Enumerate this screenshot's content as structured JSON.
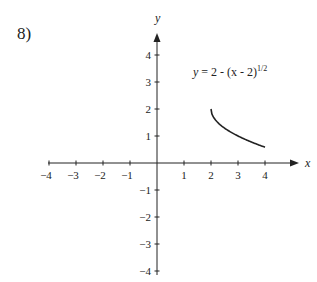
{
  "problem": {
    "number": "8)"
  },
  "chart_data": {
    "type": "line",
    "title": "",
    "xlabel": "x",
    "ylabel": "y",
    "xlim": [
      -4,
      4
    ],
    "ylim": [
      -4,
      4
    ],
    "grid": false,
    "x_ticks": [
      -4,
      -3,
      -2,
      -1,
      1,
      2,
      3,
      4
    ],
    "y_ticks": [
      4,
      3,
      2,
      1,
      -1,
      -2,
      -3,
      -4
    ],
    "annotation": {
      "text": "y = 2 - (x - 2)",
      "exponent": "1/2",
      "position": [
        2.3,
        3.4
      ]
    },
    "series": [
      {
        "name": "y = 2 - (x - 2)^(1/2)",
        "x": [
          2,
          2.05,
          2.2,
          2.5,
          3,
          3.5,
          4
        ],
        "y": [
          2,
          1.78,
          1.55,
          1.29,
          1.0,
          0.78,
          0.59
        ]
      }
    ]
  }
}
